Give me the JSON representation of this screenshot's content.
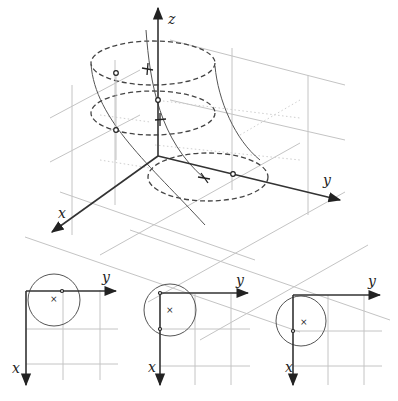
{
  "main_figure": {
    "axes": {
      "x": "x",
      "y": "y",
      "z": "z"
    },
    "description": "3D helical-like surface bounded by dashed ellipses at three heights, with grid planes"
  },
  "projections": [
    {
      "id": "left",
      "axes": {
        "x": "x",
        "y": "y"
      },
      "center_marker": "×"
    },
    {
      "id": "middle",
      "axes": {
        "x": "x",
        "y": "y"
      },
      "center_marker": "×"
    },
    {
      "id": "right",
      "axes": {
        "x": "x",
        "y": "y"
      },
      "center_marker": "×"
    }
  ],
  "colors": {
    "axis": "#333333",
    "grid": "#c4c4c4",
    "curve": "#555555"
  }
}
